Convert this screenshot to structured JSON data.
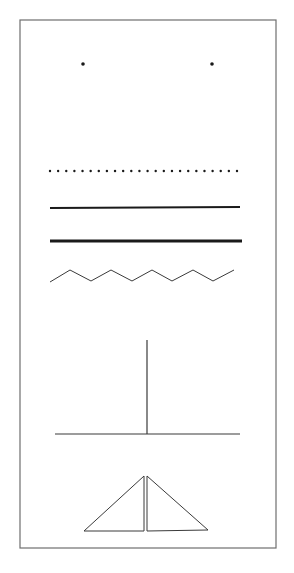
{
  "diagram": {
    "title": "",
    "colors": {
      "background": "#ffffff",
      "ink": "#1a1a1a",
      "border": "#6e6e6e",
      "thin_ink": "#3a3a3a"
    },
    "frame": {
      "x": 20,
      "y": 20,
      "width": 256,
      "height": 528
    },
    "elements": [
      {
        "id": "point-left",
        "type": "point",
        "x": 83,
        "y": 64,
        "r": 1.8
      },
      {
        "id": "point-right",
        "type": "point",
        "x": 212,
        "y": 64,
        "r": 1.8
      },
      {
        "id": "dotted-line",
        "type": "dotted-line",
        "y": 171,
        "x_start": 50,
        "x_end": 237,
        "dot_count": 24,
        "r": 1.2
      },
      {
        "id": "thin-solid-line",
        "type": "line",
        "x1": 50,
        "y1": 208,
        "x2": 240,
        "y2": 207,
        "stroke_width": 2
      },
      {
        "id": "thick-solid-line",
        "type": "line",
        "x1": 50,
        "y1": 241,
        "x2": 242,
        "y2": 241,
        "stroke_width": 3.2
      },
      {
        "id": "zigzag-line",
        "type": "polyline",
        "points": "50,282 70,270 91,281 111,270 132,281 152,270 172,281 193,270 213,281 234,270",
        "stroke_width": 1
      },
      {
        "id": "vertical-line",
        "type": "line",
        "x1": 147,
        "y1": 340,
        "x2": 147,
        "y2": 434,
        "stroke_width": 1.2
      },
      {
        "id": "horizontal-base-line",
        "type": "line",
        "x1": 55,
        "y1": 434,
        "x2": 240,
        "y2": 434,
        "stroke_width": 1.2
      },
      {
        "id": "triangle-left",
        "type": "polygon",
        "points": "84,531 144,476 144,531",
        "stroke_width": 1
      },
      {
        "id": "triangle-right",
        "type": "polygon",
        "points": "147,476 147,531 208,530",
        "stroke_width": 1
      }
    ]
  }
}
